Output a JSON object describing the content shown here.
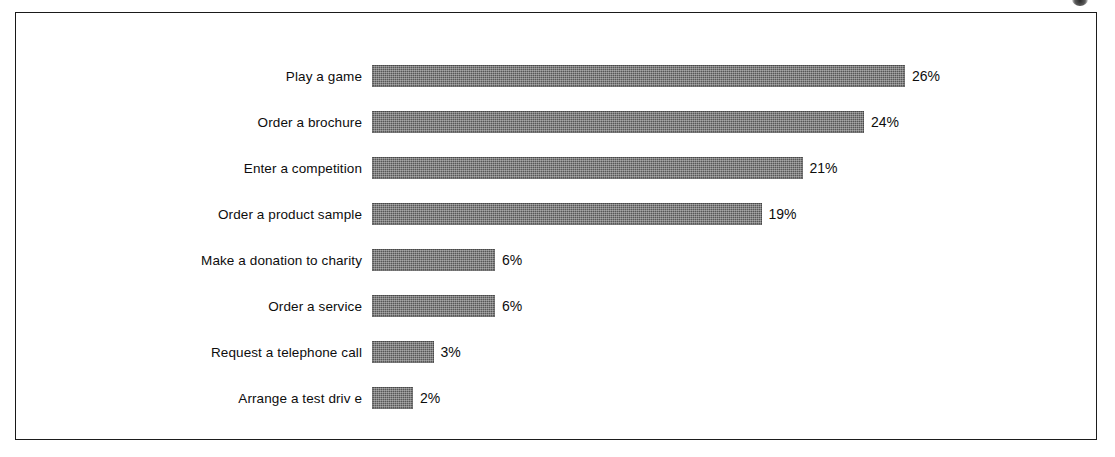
{
  "chart_data": {
    "type": "bar",
    "orientation": "horizontal",
    "title": "",
    "subtitle": "",
    "xlabel": "",
    "ylabel": "",
    "grid": false,
    "legend": false,
    "axis_visible": false,
    "value_suffix": "%",
    "xlim": [
      0,
      26
    ],
    "categories": [
      "Play  a game",
      "Order a brochure",
      "Enter a competition",
      "Order a product sample",
      "Make a donation to charity",
      "Order a service",
      "Request a telephone call",
      "Arrange a test driv e"
    ],
    "values": [
      26,
      24,
      21,
      19,
      6,
      6,
      3,
      2
    ],
    "value_labels": [
      "26%",
      "24%",
      "21%",
      "19%",
      "6%",
      "6%",
      "3%",
      "2%"
    ],
    "bar_color": "#575757",
    "text_color": "#0d0d0d",
    "frame_color": "#1d1d1d",
    "background_color": "#ffffff"
  },
  "bars": [
    {
      "label": "Play  a game",
      "value": 26,
      "value_label": "26%"
    },
    {
      "label": "Order a brochure",
      "value": 24,
      "value_label": "24%"
    },
    {
      "label": "Enter a competition",
      "value": 21,
      "value_label": "21%"
    },
    {
      "label": "Order a product sample",
      "value": 19,
      "value_label": "19%"
    },
    {
      "label": "Make a donation to charity",
      "value": 6,
      "value_label": "6%"
    },
    {
      "label": "Order a service",
      "value": 6,
      "value_label": "6%"
    },
    {
      "label": "Request a telephone call",
      "value": 3,
      "value_label": "3%"
    },
    {
      "label": "Arrange a test driv e",
      "value": 2,
      "value_label": "2%"
    }
  ],
  "layout": {
    "bar_origin_x": 356,
    "label_gap": 10,
    "value_gap": 7,
    "first_bar_top": 52,
    "row_pitch": 46,
    "bar_height": 22,
    "px_per_unit": 20.5
  }
}
